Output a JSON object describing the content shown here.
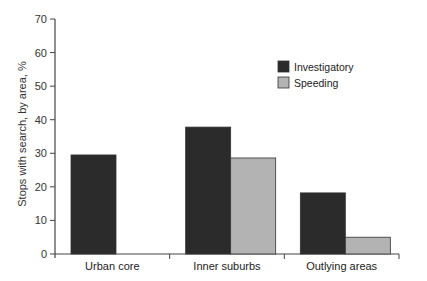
{
  "chart_data": {
    "type": "bar",
    "title": "",
    "xlabel": "",
    "ylabel": "Stops with search, by area, %",
    "ylim": [
      0,
      70
    ],
    "yticks": [
      0,
      10,
      20,
      30,
      40,
      50,
      60,
      70
    ],
    "grid": false,
    "legend_position": "upper right",
    "categories": [
      "Urban core",
      "Inner suburbs",
      "Outlying areas"
    ],
    "series": [
      {
        "name": "Investigatory",
        "color": "#2b2b2b",
        "values": [
          29.5,
          37.8,
          18.2
        ]
      },
      {
        "name": "Speeding",
        "color": "#b3b3b3",
        "values": [
          null,
          28.6,
          5.0
        ]
      }
    ]
  }
}
